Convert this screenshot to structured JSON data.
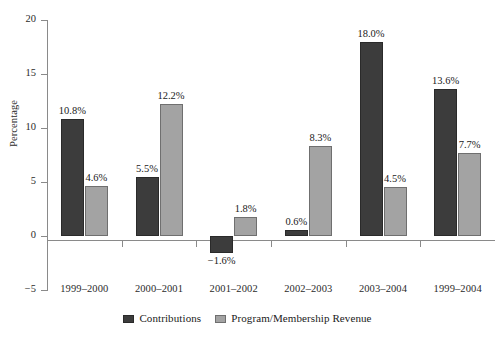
{
  "chart_data": {
    "type": "bar",
    "title": "",
    "xlabel": "",
    "ylabel": "Percentage",
    "ylim": [
      -5,
      20
    ],
    "yticks": [
      20,
      15,
      10,
      5,
      0,
      -5
    ],
    "ytick_labels": [
      "20",
      "15",
      "10",
      "5",
      "0",
      "−5"
    ],
    "grid": false,
    "legend_position": "bottom-center",
    "categories": [
      "1999–2000",
      "2000–2001",
      "2001–2002",
      "2002–2003",
      "2003–2004",
      "1999–2004"
    ],
    "series": [
      {
        "name": "Contributions",
        "color": "#3c3c3c",
        "values": [
          10.8,
          5.5,
          -1.6,
          0.6,
          18.0,
          13.6
        ],
        "labels": [
          "10.8%",
          "5.5%",
          "−1.6%",
          "0.6%",
          "18.0%",
          "13.6%"
        ]
      },
      {
        "name": "Program/Membership Revenue",
        "color": "#a3a3a3",
        "values": [
          4.6,
          12.2,
          1.8,
          8.3,
          4.5,
          7.7
        ],
        "labels": [
          "4.6%",
          "12.2%",
          "1.8%",
          "8.3%",
          "4.5%",
          "7.7%"
        ]
      }
    ]
  },
  "legend": {
    "items": [
      {
        "label": "Contributions"
      },
      {
        "label": "Program/Membership Revenue"
      }
    ]
  },
  "axes": {
    "y_title": "Percentage"
  }
}
